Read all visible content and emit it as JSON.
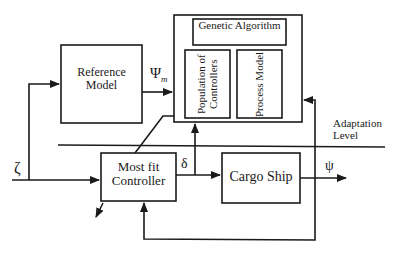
{
  "diagram": {
    "blocks": {
      "reference_model": "Reference Model",
      "genetic_algorithm": "Genetic Algorithm",
      "population_of_controllers": "Population of Controllers",
      "process_model": "Process Model",
      "most_fit_controller": "Most fit Controller",
      "cargo_ship": "Cargo Ship"
    },
    "signals": {
      "zeta": "ζ",
      "psi_m": "Ψ",
      "psi_m_subscript": "m",
      "delta": "δ",
      "psi": "ψ"
    },
    "annotations": {
      "adaptation_level": "Adaptation Level"
    }
  }
}
